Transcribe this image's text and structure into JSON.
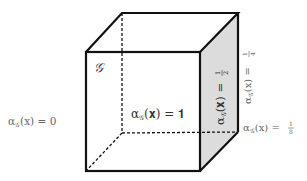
{
  "diagram": {
    "colors": {
      "edge": "#111111",
      "shaded_face": "#dcdcdc",
      "label": "#333333",
      "label_light": "#6a6a6a"
    },
    "labels": {
      "graph_name": "𝒢",
      "interior": {
        "alpha": "α",
        "sub": "𝒢",
        "arg": "(𝐱) = 𝟏"
      },
      "outside": {
        "alpha": "α",
        "sub": "𝒢",
        "arg": "(x) = 0"
      },
      "face": {
        "alpha": "α",
        "sub": "𝒢",
        "arg": "(𝐱) = ",
        "num": "1",
        "den": "2"
      },
      "edge": {
        "alpha": "α",
        "sub": "𝒢",
        "arg": "(x) = ",
        "num": "1",
        "den": "4"
      },
      "vertex": {
        "alpha": "α",
        "sub": "𝒢",
        "arg": "(x) = ",
        "num": "1",
        "den": "8"
      }
    }
  }
}
